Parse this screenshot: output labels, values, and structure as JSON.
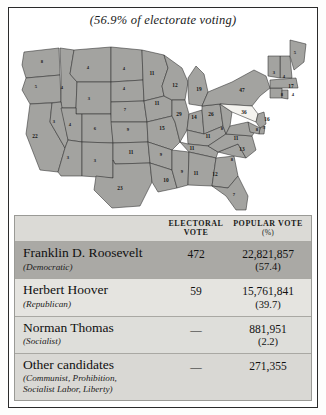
{
  "caption": "(56.9% of electorate voting)",
  "table": {
    "headers": {
      "name": "",
      "electoral_line1": "ELECTORAL",
      "electoral_line2": "VOTE",
      "popular_line1": "POPULAR VOTE",
      "popular_line2": "(%)"
    },
    "rows": [
      {
        "candidate": "Franklin D. Roosevelt",
        "party": "(Democratic)",
        "electoral": "472",
        "popular": "22,821,857",
        "percent": "(57.4)"
      },
      {
        "candidate": "Herbert Hoover",
        "party": "(Republican)",
        "electoral": "59",
        "popular": "15,761,841",
        "percent": "(39.7)"
      },
      {
        "candidate": "Norman Thomas",
        "party": "(Socialist)",
        "electoral": "—",
        "popular": "881,951",
        "percent": "(2.2)"
      },
      {
        "candidate": "Other candidates",
        "party": "(Communist, Prohibition,\nSocialist Labor, Liberty)",
        "electoral": "—",
        "popular": "271,355",
        "percent": ""
      }
    ]
  },
  "map": {
    "type": "choropleth-electoral",
    "winner_shade": "#a3a3a0",
    "loser_shade": "#f4f3ef",
    "states": [
      {
        "code": "WA",
        "votes": "8",
        "x": 30,
        "y": 33
      },
      {
        "code": "OR",
        "votes": "5",
        "x": 24,
        "y": 58
      },
      {
        "code": "CA",
        "votes": "22",
        "x": 23,
        "y": 108
      },
      {
        "code": "ID",
        "votes": "4",
        "x": 50,
        "y": 59
      },
      {
        "code": "NV",
        "votes": "3",
        "x": 42,
        "y": 93
      },
      {
        "code": "MT",
        "votes": "4",
        "x": 76,
        "y": 39
      },
      {
        "code": "WY",
        "votes": "3",
        "x": 77,
        "y": 70
      },
      {
        "code": "UT",
        "votes": "4",
        "x": 58,
        "y": 96
      },
      {
        "code": "AZ",
        "votes": "3",
        "x": 56,
        "y": 129
      },
      {
        "code": "CO",
        "votes": "6",
        "x": 83,
        "y": 100
      },
      {
        "code": "NM",
        "votes": "3",
        "x": 83,
        "y": 132
      },
      {
        "code": "ND",
        "votes": "4",
        "x": 112,
        "y": 40
      },
      {
        "code": "SD",
        "votes": "4",
        "x": 112,
        "y": 60
      },
      {
        "code": "NE",
        "votes": "7",
        "x": 113,
        "y": 81
      },
      {
        "code": "KS",
        "votes": "9",
        "x": 116,
        "y": 101
      },
      {
        "code": "OK",
        "votes": "11",
        "x": 119,
        "y": 124
      },
      {
        "code": "TX",
        "votes": "23",
        "x": 108,
        "y": 160
      },
      {
        "code": "MN",
        "votes": "11",
        "x": 140,
        "y": 45
      },
      {
        "code": "IA",
        "votes": "11",
        "x": 145,
        "y": 75
      },
      {
        "code": "MO",
        "votes": "15",
        "x": 150,
        "y": 100
      },
      {
        "code": "AR",
        "votes": "9",
        "x": 149,
        "y": 126
      },
      {
        "code": "LA",
        "votes": "10",
        "x": 154,
        "y": 152
      },
      {
        "code": "WI",
        "votes": "12",
        "x": 163,
        "y": 57
      },
      {
        "code": "IL",
        "votes": "29",
        "x": 167,
        "y": 86
      },
      {
        "code": "MS",
        "votes": "9",
        "x": 170,
        "y": 143
      },
      {
        "code": "MI",
        "votes": "19",
        "x": 187,
        "y": 61
      },
      {
        "code": "IN",
        "votes": "14",
        "x": 182,
        "y": 89
      },
      {
        "code": "TN",
        "votes": "11",
        "x": 180,
        "y": 120
      },
      {
        "code": "AL",
        "votes": "11",
        "x": 184,
        "y": 145
      },
      {
        "code": "OH",
        "votes": "26",
        "x": 199,
        "y": 86
      },
      {
        "code": "KY",
        "votes": "11",
        "x": 196,
        "y": 108
      },
      {
        "code": "GA",
        "votes": "12",
        "x": 203,
        "y": 146
      },
      {
        "code": "WV",
        "votes": "8",
        "x": 210,
        "y": 100
      },
      {
        "code": "FL",
        "votes": "7",
        "x": 222,
        "y": 166
      },
      {
        "code": "SC",
        "votes": "8",
        "x": 220,
        "y": 131
      },
      {
        "code": "NY",
        "votes": "47",
        "x": 230,
        "y": 62
      },
      {
        "code": "PA",
        "votes": "36",
        "x": 232,
        "y": 84
      },
      {
        "code": "VA",
        "votes": "11",
        "x": 224,
        "y": 110
      },
      {
        "code": "NC",
        "votes": "13",
        "x": 230,
        "y": 121
      },
      {
        "code": "ME",
        "votes": "5",
        "x": 283,
        "y": 24
      },
      {
        "code": "VT",
        "votes": "3",
        "x": 262,
        "y": 44
      },
      {
        "code": "NH",
        "votes": "4",
        "x": 272,
        "y": 48
      },
      {
        "code": "MA",
        "votes": "17",
        "x": 279,
        "y": 58
      },
      {
        "code": "RI",
        "votes": "4",
        "x": 281,
        "y": 66
      },
      {
        "code": "CT",
        "votes": "8",
        "x": 270,
        "y": 66
      },
      {
        "code": "NJ",
        "votes": "16",
        "x": 255,
        "y": 91
      },
      {
        "code": "DE",
        "votes": "3",
        "x": 252,
        "y": 99
      },
      {
        "code": "MD",
        "votes": "8",
        "x": 245,
        "y": 101
      }
    ]
  }
}
